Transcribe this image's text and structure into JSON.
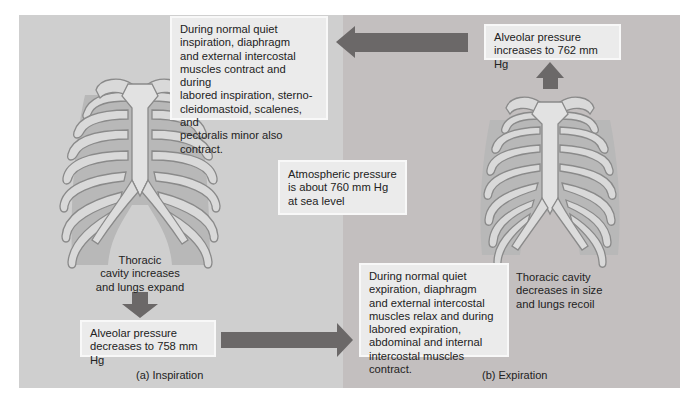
{
  "figure": {
    "panels": [
      {
        "id": "inspiration",
        "caption": "(a) Inspiration",
        "muscle_note": "During normal quiet\ninspiration, diaphragm\nand external intercostal\nmuscles contract and during\nlabored inspiration, sterno-\ncleidomastoid, scalenes, and\npectoralis minor also contract.",
        "cavity_note": "Thoracic\ncavity increases\nand lungs expand",
        "pressure_note": "Alveolar pressure\ndecreases to 758 mm Hg",
        "alveolar_pressure_mmHg": 758
      },
      {
        "id": "expiration",
        "caption": "(b) Expiration",
        "muscle_note": "During normal quiet\nexpiration, diaphragm\nand external intercostal\nmuscles relax and during\nlabored expiration,\nabdominal and internal\nintercostal muscles contract.",
        "cavity_note": "Thoracic cavity\ndecreases in size\nand lungs recoil",
        "pressure_note": "Alveolar pressure\nincreases to 762 mm Hg",
        "alveolar_pressure_mmHg": 762
      }
    ],
    "center_note": "Atmospheric pressure\nis about 760 mm Hg\nat sea level",
    "atmospheric_pressure_mmHg": 760,
    "icons": {
      "ribcage_left": "ribcage-expanded",
      "ribcage_right": "ribcage-relaxed",
      "arrows": [
        "arrow-left",
        "arrow-right",
        "arrow-down",
        "arrow-up"
      ]
    },
    "colors": {
      "panel_left_bg": "#cfcfcf",
      "panel_right_bg": "#c3bfbf",
      "arrow": "#6b6868",
      "box_bg": "#ebebeb",
      "bone": "#d9d9d9",
      "bone_outline": "#8a8a8a"
    }
  }
}
